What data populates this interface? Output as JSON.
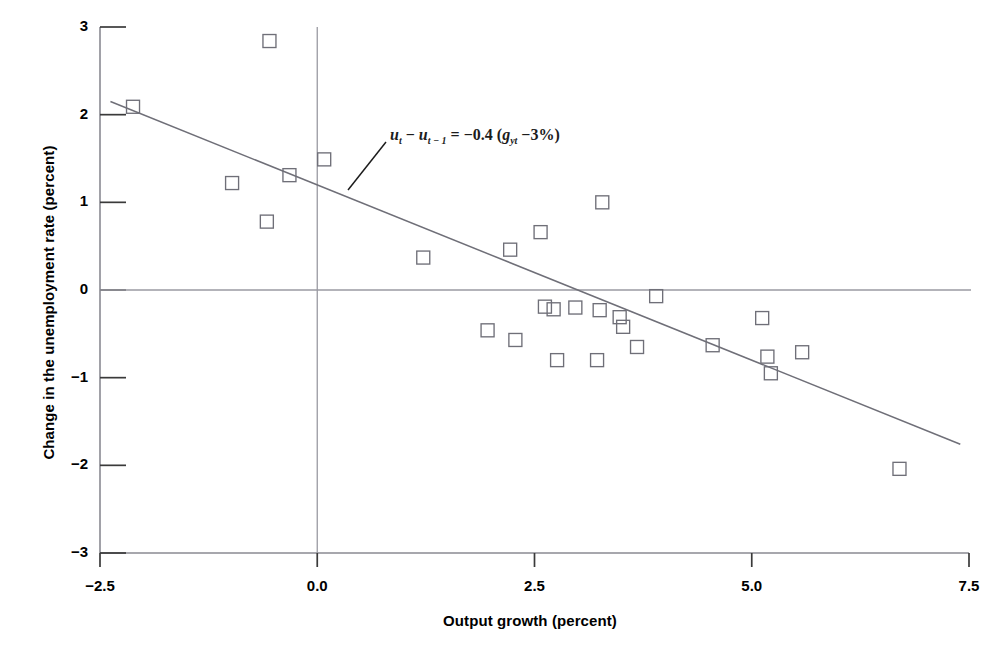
{
  "chart_data": {
    "type": "scatter",
    "title": "",
    "xlabel": "Output growth (percent)",
    "ylabel": "Change in the unemployment rate (percent)",
    "xlim": [
      -2.5,
      7.5
    ],
    "ylim": [
      -3,
      3
    ],
    "xticks": [
      "-2.5",
      "0.0",
      "2.5",
      "5.0",
      "7.5"
    ],
    "xtick_values": [
      -2.5,
      0.0,
      2.5,
      5.0,
      7.5
    ],
    "yticks": [
      "3",
      "2",
      "1",
      "0",
      "-1",
      "-2",
      "-3"
    ],
    "ytick_values": [
      3,
      2,
      1,
      0,
      -1,
      -2,
      -3
    ],
    "grid": false,
    "legend": null,
    "marker": "open-square",
    "marker_color": "#6f6f78",
    "line_color": "#6f6f78",
    "points": [
      {
        "x": -2.12,
        "y": 2.09
      },
      {
        "x": -0.55,
        "y": 2.84
      },
      {
        "x": -0.98,
        "y": 1.22
      },
      {
        "x": -0.58,
        "y": 0.78
      },
      {
        "x": -0.32,
        "y": 1.31
      },
      {
        "x": 0.08,
        "y": 1.49
      },
      {
        "x": 1.22,
        "y": 0.37
      },
      {
        "x": 2.22,
        "y": 0.46
      },
      {
        "x": 2.57,
        "y": 0.66
      },
      {
        "x": 3.28,
        "y": 1.0
      },
      {
        "x": 1.96,
        "y": -0.46
      },
      {
        "x": 2.28,
        "y": -0.57
      },
      {
        "x": 2.62,
        "y": -0.19
      },
      {
        "x": 2.72,
        "y": -0.22
      },
      {
        "x": 2.97,
        "y": -0.2
      },
      {
        "x": 3.25,
        "y": -0.23
      },
      {
        "x": 3.48,
        "y": -0.31
      },
      {
        "x": 3.52,
        "y": -0.42
      },
      {
        "x": 3.68,
        "y": -0.65
      },
      {
        "x": 3.9,
        "y": -0.07
      },
      {
        "x": 2.76,
        "y": -0.8
      },
      {
        "x": 3.22,
        "y": -0.8
      },
      {
        "x": 4.55,
        "y": -0.63
      },
      {
        "x": 5.12,
        "y": -0.32
      },
      {
        "x": 5.18,
        "y": -0.76
      },
      {
        "x": 5.22,
        "y": -0.95
      },
      {
        "x": 5.58,
        "y": -0.71
      },
      {
        "x": 6.7,
        "y": -2.04
      }
    ],
    "fit_line": {
      "slope": -0.4,
      "intercept": 1.2,
      "x_start": -2.38,
      "x_end": 7.4,
      "y_start": 2.15,
      "y_end": -1.76
    },
    "annotation": {
      "text": "u_t - u_{t-1} = -0.4 (g_yt - 3%)",
      "parts": {
        "u1": "u",
        "sub1": "t",
        "minus1": " − ",
        "u2": "u",
        "sub2": "t − 1",
        "equals": " = −0.4 (",
        "g": "g",
        "subg": "yt",
        "tail": " −3%)"
      },
      "leader_line": true
    },
    "reference_lines": [
      {
        "axis": "y",
        "value": 0
      },
      {
        "axis": "x",
        "value": 0
      }
    ]
  }
}
